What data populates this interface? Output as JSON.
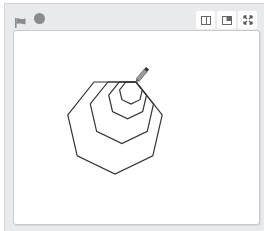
{
  "toolbar": {
    "left_icons": [
      "green-flag-icon",
      "stop-icon"
    ],
    "right_buttons": [
      {
        "name": "small-stage-button",
        "icon": "small-stage-icon"
      },
      {
        "name": "normal-stage-button",
        "icon": "normal-stage-icon"
      },
      {
        "name": "fullscreen-button",
        "icon": "fullscreen-icon"
      }
    ]
  },
  "stage": {
    "drawing": {
      "shape": "heptagon",
      "sides": 7,
      "count": 4,
      "relative_sizes": [
        1.0,
        0.67,
        0.4,
        0.24
      ],
      "pen_color": "#333333",
      "sprite": "pencil"
    }
  },
  "colors": {
    "panel_bg": "#e9eaec",
    "stage_bg": "#ffffff",
    "icon_gray": "#8a8b8e",
    "pen": "#333333"
  }
}
